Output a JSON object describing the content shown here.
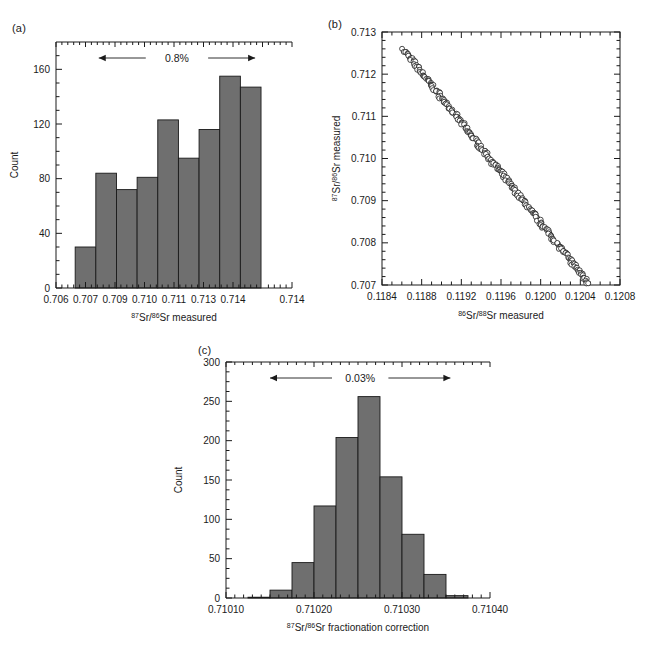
{
  "figure": {
    "background": "#ffffff",
    "bar_fill": "#6f6f6f",
    "bar_stroke": "#1a1a1a",
    "axis_color": "#1a1a1a",
    "marker_fill": "#ffffff",
    "marker_stroke": "#111111"
  },
  "panels": {
    "a": {
      "letter": "(a)",
      "annotation": "0.8%",
      "chart_data": {
        "type": "bar",
        "title": "",
        "xlabel_parts": {
          "sup1": "87",
          "mid": "Sr/",
          "sup2": "86",
          "rest": "Sr measured"
        },
        "xlabel": "87Sr/86Sr measured",
        "ylabel": "Count",
        "xlim": [
          0.706,
          0.714
        ],
        "ylim": [
          0,
          180
        ],
        "xticks": [
          "0.706",
          "0.707",
          "0.709",
          "0.710",
          "0.711",
          "0.713",
          "0.714"
        ],
        "xtick_values": [
          0.706,
          0.707,
          0.708,
          0.709,
          0.71,
          0.711,
          0.712
        ],
        "yticks": [
          "0",
          "40",
          "80",
          "120",
          "160"
        ],
        "ytick_values": [
          0,
          40,
          80,
          120,
          160
        ],
        "grid": false,
        "bin_edges": [
          0.70665,
          0.70735,
          0.70805,
          0.70875,
          0.70945,
          0.71015,
          0.71085,
          0.71155,
          0.71225,
          0.71295
        ],
        "categories": [
          "0.7067",
          "0.7074",
          "0.7081",
          "0.7088",
          "0.7095",
          "0.7102",
          "0.7109",
          "0.7116",
          "0.7123"
        ],
        "values": [
          30,
          84,
          72,
          81,
          123,
          95,
          116,
          155,
          147
        ],
        "annotation_span": [
          0.70745,
          0.71275
        ]
      }
    },
    "b": {
      "letter": "(b)",
      "chart_data": {
        "type": "scatter",
        "title": "",
        "xlabel_parts": {
          "sup1": "86",
          "mid": "Sr/",
          "sup2": "88",
          "rest": "Sr measured"
        },
        "xlabel": "86Sr/88Sr measured",
        "ylabel_parts": {
          "sup1": "87",
          "mid": "Sr/",
          "sup2": "86",
          "rest": "Sr measured"
        },
        "ylabel": "87Sr/86Sr measured",
        "xlim": [
          0.1184,
          0.1208
        ],
        "ylim": [
          0.707,
          0.713
        ],
        "xticks": [
          "0.1184",
          "0.1188",
          "0.1192",
          "0.1196",
          "0.1200",
          "0.1204",
          "0.1208"
        ],
        "xtick_values": [
          0.1184,
          0.1188,
          0.1192,
          0.1196,
          0.12,
          0.1204,
          0.1208
        ],
        "yticks": [
          "0.707",
          "0.708",
          "0.709",
          "0.710",
          "0.711",
          "0.712",
          "0.713"
        ],
        "ytick_values": [
          0.707,
          0.708,
          0.709,
          0.71,
          0.711,
          0.712,
          0.713
        ],
        "grid": false,
        "marker": "open-circle",
        "n_points": 260,
        "trend": "negative-linear",
        "x_range_data": [
          0.11862,
          0.12048
        ],
        "y_range_data": [
          0.70705,
          0.71257
        ],
        "scatter_spread": 0.00012
      }
    },
    "c": {
      "letter": "(c)",
      "annotation": "0.03%",
      "chart_data": {
        "type": "bar",
        "title": "",
        "xlabel_parts": {
          "sup1": "87",
          "mid": "Sr/",
          "sup2": "86",
          "rest": "Sr fractionation correction"
        },
        "xlabel": "87Sr/86Sr fractionation correction",
        "ylabel": "Count",
        "xlim": [
          0.7101,
          0.7104
        ],
        "ylim": [
          0,
          300
        ],
        "xticks": [
          "0.71010",
          "0.71020",
          "0.71030",
          "0.71040"
        ],
        "xtick_values": [
          0.7101,
          0.7102,
          0.7103,
          0.7104
        ],
        "yticks": [
          "0",
          "50",
          "100",
          "150",
          "200",
          "250",
          "300"
        ],
        "ytick_values": [
          0,
          50,
          100,
          150,
          200,
          250,
          300
        ],
        "grid": false,
        "bin_edges": [
          0.710125,
          0.71015,
          0.710175,
          0.7102,
          0.710225,
          0.71025,
          0.710275,
          0.7103,
          0.710325,
          0.71035,
          0.710375
        ],
        "categories": [
          "0.710138",
          "0.710163",
          "0.710188",
          "0.710213",
          "0.710238",
          "0.710263",
          "0.710288",
          "0.710313",
          "0.710338",
          "0.710363"
        ],
        "values": [
          1,
          10,
          45,
          117,
          204,
          256,
          154,
          81,
          30,
          3
        ],
        "annotation_span": [
          0.71015,
          0.710355
        ]
      }
    }
  }
}
